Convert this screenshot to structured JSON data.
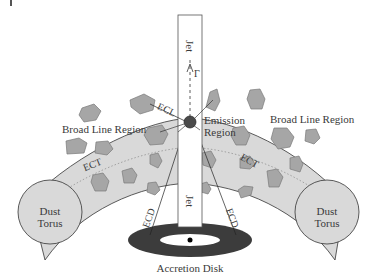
{
  "figure": {
    "colors": {
      "background": "#ffffff",
      "torus_fill": "#d9d9d9",
      "torus_stroke": "#333333",
      "cloud_fill": "#a6a6a6",
      "cloud_stroke": "#7a7a7a",
      "disk_fill": "#3c3c3c",
      "jet_fill": "#ffffff",
      "emission_fill": "#4a4a4a",
      "text": "#3a3a3a"
    },
    "labels": {
      "jet_top": "Jet",
      "jet_bottom": "Jet",
      "gamma": "Γ",
      "emission_region_line1": "Emission",
      "emission_region_line2": "Region",
      "blr_left": "Broad Line Region",
      "blr_right": "Broad Line Region",
      "ecl": "ECL",
      "ect_left": "ECT",
      "ect_right": "ECT",
      "ecd_left": "ECD",
      "ecd_right": "ECD",
      "dust_left_line1": "Dust",
      "dust_left_line2": "Torus",
      "dust_right_line1": "Dust",
      "dust_right_line2": "Torus",
      "accretion_disk": "Accretion Disk"
    }
  }
}
